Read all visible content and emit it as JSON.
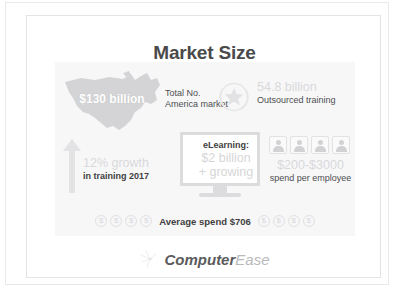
{
  "slide": {
    "title": "Market Size"
  },
  "stats": {
    "market": {
      "icon": "us-map-icon",
      "value": "$130 billion",
      "caption_line1": "Total No.",
      "caption_line2": "America market"
    },
    "outsourced": {
      "icon": "star-badge-icon",
      "value": "54.8 billion",
      "caption": "Outsourced training"
    },
    "growth": {
      "icon": "up-arrow-icon",
      "value": "12% growth",
      "caption": "in training 2017"
    },
    "elearning": {
      "icon": "monitor-icon",
      "label": "eLearning:",
      "value_line1": "$2 billion",
      "value_line2": "+ growing"
    },
    "spend": {
      "icon": "people-icon",
      "people_count": 4,
      "value": "$200-$3000",
      "caption": "spend per employee"
    },
    "average_spend": {
      "label": "Average spend $706",
      "coin_glyph": "$",
      "coins_left": 4,
      "coins_right": 4
    }
  },
  "footer": {
    "icon": "sparkle-icon",
    "logo_primary": "Computer",
    "logo_secondary": "Ease"
  },
  "colors": {
    "title": "#4a4a4c",
    "panel_background": "#f7f7f8",
    "muted_value": "#d9d9db",
    "dark_text": "#3f3f41",
    "icon_gray": "#d2d2d4",
    "frame_border": "#e9e9ea"
  }
}
